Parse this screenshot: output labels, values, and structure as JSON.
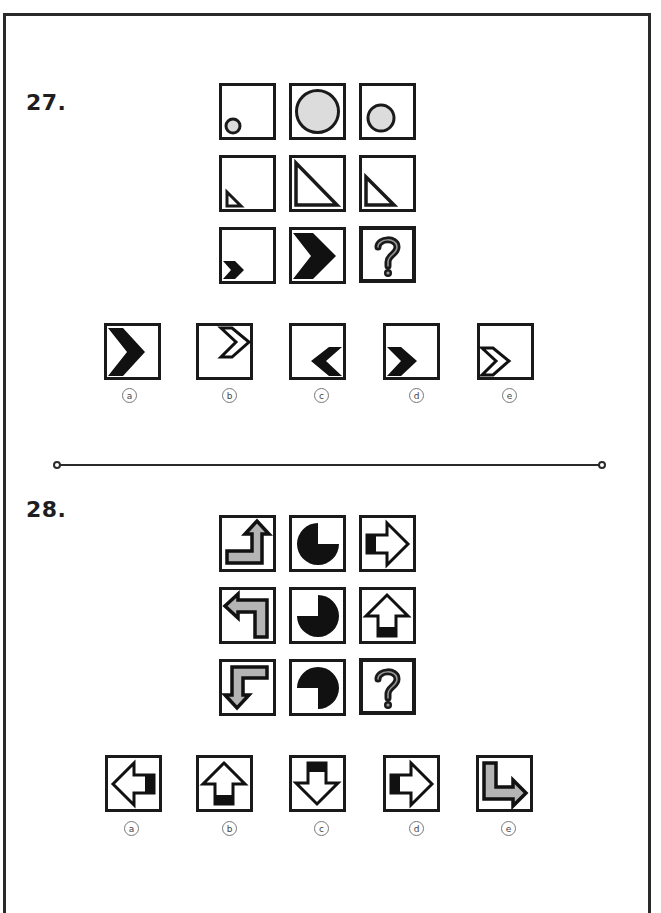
{
  "questions": [
    {
      "number": "27.",
      "grid": [
        [
          "small-circle-bottom-left",
          "large-circle-filling",
          "medium-circle-center"
        ],
        [
          "small-triangle-bottom-left",
          "large-triangle-filling",
          "medium-triangle-bottom-left"
        ],
        [
          "small-chevron-bottom-left",
          "large-chevron-filling",
          "question-mark"
        ]
      ],
      "options": [
        {
          "label": "a",
          "figure": "large-solid-chevron-right"
        },
        {
          "label": "b",
          "figure": "outline-chevron-right-top-right"
        },
        {
          "label": "c",
          "figure": "solid-chevron-left-bottom-right"
        },
        {
          "label": "d",
          "figure": "solid-chevron-right-bottom-left"
        },
        {
          "label": "e",
          "figure": "outline-chevron-right-bottom-left"
        }
      ]
    },
    {
      "number": "28.",
      "grid": [
        [
          "bent-arrow-up-gray",
          "pie-missing-top-right",
          "arrow-right-outline"
        ],
        [
          "bent-arrow-left-gray",
          "pie-missing-top-left",
          "arrow-up-outline"
        ],
        [
          "bent-arrow-down-gray",
          "pie-missing-bottom-left",
          "question-mark"
        ]
      ],
      "options": [
        {
          "label": "a",
          "figure": "arrow-left-outline"
        },
        {
          "label": "b",
          "figure": "arrow-up-outline"
        },
        {
          "label": "c",
          "figure": "arrow-down-outline"
        },
        {
          "label": "d",
          "figure": "arrow-right-outline"
        },
        {
          "label": "e",
          "figure": "bent-arrow-right-gray"
        }
      ]
    }
  ],
  "colors": {
    "ink": "#1a1a1a",
    "gray_fill": "#b4b4b4",
    "circle_fill": "#dcdcdc",
    "qmark_highlight": "#9a9a9a"
  }
}
